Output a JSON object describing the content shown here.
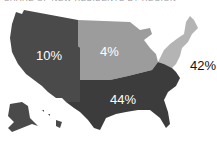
{
  "title": "SHARE OF NEW RESIDENTS BY REGION",
  "colors": {
    "west": "#4a4a4a",
    "south": "#3c3c3c",
    "midwest": "#9c9c9c",
    "northeast": "#b4b4b4",
    "background": "#ffffff"
  },
  "regions": {
    "west": {
      "name": "West",
      "value": "10%"
    },
    "midwest": {
      "name": "Midwest",
      "value": "4%"
    },
    "northeast": {
      "name": "Northeast",
      "value": "42%"
    },
    "south": {
      "name": "South",
      "value": "44%"
    }
  }
}
